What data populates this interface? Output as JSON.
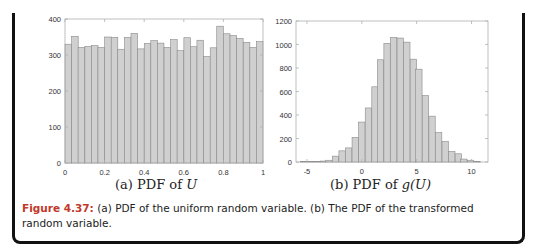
{
  "chart_data": [
    {
      "type": "bar",
      "title": "(a) PDF of U",
      "xlabel": "",
      "ylabel": "",
      "xlim": [
        0,
        1
      ],
      "ylim": [
        0,
        400
      ],
      "xticks": [
        "0",
        "0.2",
        "0.4",
        "0.6",
        "0.8",
        "1"
      ],
      "yticks": [
        "0",
        "100",
        "200",
        "300",
        "400"
      ],
      "grid": false,
      "bin_width": 0.0333,
      "x": [
        0.017,
        0.05,
        0.083,
        0.117,
        0.15,
        0.183,
        0.217,
        0.25,
        0.283,
        0.317,
        0.35,
        0.383,
        0.417,
        0.45,
        0.483,
        0.517,
        0.55,
        0.583,
        0.617,
        0.65,
        0.683,
        0.717,
        0.75,
        0.783,
        0.817,
        0.85,
        0.883,
        0.917,
        0.95,
        0.983
      ],
      "values": [
        330,
        352,
        321,
        324,
        326,
        321,
        350,
        349,
        316,
        349,
        360,
        317,
        332,
        340,
        333,
        321,
        343,
        312,
        348,
        323,
        341,
        296,
        320,
        380,
        359,
        354,
        346,
        335,
        321,
        337
      ]
    },
    {
      "type": "bar",
      "title": "(b) PDF of g(U)",
      "xlabel": "",
      "ylabel": "",
      "xlim": [
        -6,
        11.5
      ],
      "ylim": [
        0,
        1200
      ],
      "xticks": [
        "-5",
        "0",
        "5",
        "10"
      ],
      "yticks": [
        "0",
        "200",
        "400",
        "600",
        "800",
        "1000",
        "1200"
      ],
      "grid": false,
      "bin_width": 0.58,
      "x": [
        -5.3,
        -4.7,
        -4.1,
        -3.5,
        -3.0,
        -2.4,
        -1.8,
        -1.2,
        -0.6,
        0.0,
        0.6,
        1.2,
        1.7,
        2.3,
        2.9,
        3.5,
        4.1,
        4.7,
        5.2,
        5.8,
        6.4,
        7.0,
        7.6,
        8.2,
        8.8,
        9.3,
        9.9,
        10.5
      ],
      "values": [
        3,
        4,
        5,
        8,
        15,
        50,
        95,
        120,
        210,
        340,
        460,
        640,
        870,
        1010,
        1060,
        1055,
        1020,
        875,
        790,
        565,
        390,
        250,
        175,
        90,
        70,
        25,
        15,
        5
      ]
    }
  ],
  "figure": {
    "subcaption_a_prefix": "(a) PDF of ",
    "subcaption_a_var": "U",
    "subcaption_b_prefix": "(b) PDF of ",
    "subcaption_b_var": "g",
    "subcaption_b_arg": "(U)",
    "caption_label": "Figure 4.37:",
    "caption_text": " (a) PDF of the uniform random variable. (b) The PDF of the transformed random variable."
  },
  "colors": {
    "bar_fill": "#d0d0d0",
    "bar_edge": "#8a8a8a",
    "axis": "#b0b0b0",
    "frame": "#111111",
    "caption_label": "#c0392b"
  }
}
